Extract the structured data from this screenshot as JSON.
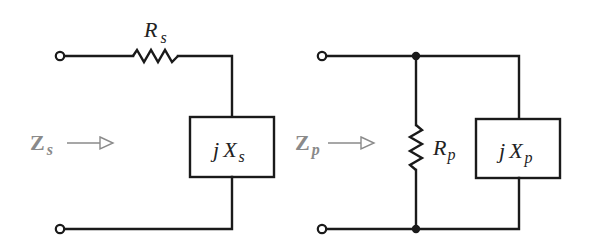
{
  "figure": {
    "series_circuit": {
      "resistor": {
        "symbol": "R",
        "subscript": "s"
      },
      "reactance_box": {
        "prefix": "j",
        "symbol": "X",
        "subscript": "s"
      },
      "impedance_label": {
        "symbol": "Z",
        "subscript": "s"
      }
    },
    "parallel_circuit": {
      "resistor": {
        "symbol": "R",
        "subscript": "p"
      },
      "reactance_box": {
        "prefix": "j",
        "symbol": "X",
        "subscript": "p"
      },
      "impedance_label": {
        "symbol": "Z",
        "subscript": "p"
      }
    }
  },
  "colors": {
    "wire": "#1a1a1a",
    "impedance_label": "#8a8a8a"
  }
}
